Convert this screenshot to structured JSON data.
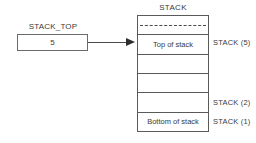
{
  "diagram": {
    "pointer_variable": {
      "label": "STACK_TOP",
      "value": "5"
    },
    "stack": {
      "title": "STACK",
      "cells": [
        {
          "text": "",
          "dashed": true
        },
        {
          "text": "Top of stack",
          "dashed": false
        },
        {
          "text": "",
          "dashed": false
        },
        {
          "text": "",
          "dashed": false
        },
        {
          "text": "",
          "dashed": false
        },
        {
          "text": "Bottom of stack",
          "dashed": false
        }
      ],
      "index_labels": [
        {
          "text": "STACK (5)",
          "top": 38
        },
        {
          "text": "STACK (2)",
          "top": 98
        },
        {
          "text": "STACK (1)",
          "top": 117
        }
      ]
    },
    "colors": {
      "line": "#5a5a5a",
      "text": "#3a3a3a",
      "arrow": "#2e2e2e",
      "background": "#ffffff"
    }
  }
}
